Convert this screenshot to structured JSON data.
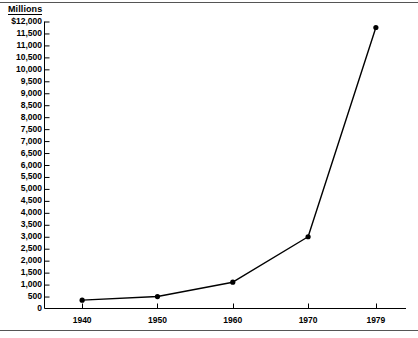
{
  "chart_data": {
    "type": "line",
    "title": "",
    "subtitle": "",
    "unit_label": "Millions",
    "xlabel": "",
    "ylabel": "",
    "x": [
      1940,
      1950,
      1960,
      1970,
      1979
    ],
    "categories": [
      "1940",
      "1950",
      "1960",
      "1970",
      "1979"
    ],
    "values": [
      350,
      500,
      1100,
      3000,
      11750
    ],
    "series": [
      {
        "name": "Amount",
        "values": [
          350,
          500,
          1100,
          3000,
          11750
        ]
      }
    ],
    "ylim": [
      0,
      12000
    ],
    "ytick_step": 500,
    "xlim": [
      1935,
      1983
    ],
    "grid": false,
    "legend": false,
    "legend_position": "none",
    "marker": "filled-circle",
    "line_color": "#000000",
    "marker_color": "#000000",
    "axis_color": "#000000",
    "background_color": "#ffffff",
    "y_tick_labels": [
      "$12,000",
      "11,500",
      "11,000",
      "10,500",
      "10,000",
      "9,500",
      "9,000",
      "8,500",
      "8,000",
      "7,500",
      "7,000",
      "6,500",
      "6,000",
      "5,500",
      "5,000",
      "4,500",
      "4,000",
      "3,500",
      "3,000",
      "2,500",
      "2,000",
      "1,500",
      "1,000",
      "500",
      "0"
    ],
    "y_tick_values": [
      12000,
      11500,
      11000,
      10500,
      10000,
      9500,
      9000,
      8500,
      8000,
      7500,
      7000,
      6500,
      6000,
      5500,
      5000,
      4500,
      4000,
      3500,
      3000,
      2500,
      2000,
      1500,
      1000,
      500,
      0
    ],
    "x_tick_labels": [
      "1940",
      "1950",
      "1960",
      "1970",
      "1979"
    ],
    "x_tick_values": [
      1940,
      1950,
      1960,
      1970,
      1979
    ]
  }
}
